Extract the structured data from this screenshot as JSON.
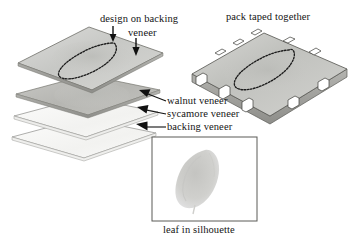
{
  "figure": {
    "background_color": "#ffffff",
    "ink_color": "#141414"
  },
  "labels": {
    "design_on_backing": "design on backing",
    "veneer_second_line": "veneer",
    "pack_taped_together": "pack taped together",
    "walnut_veneer": "walnut veneer",
    "sycamore_veneer": "sycamore veneer",
    "backing_veneer": "backing veneer",
    "leaf_in_silhouette": "leaf in silhouette"
  },
  "diagram": {
    "stack": {
      "name": "exploded veneer stack",
      "layer_count": 4,
      "layers": [
        {
          "name": "design on backing veneer",
          "fill": "#cfd0ce",
          "edge": "#6b6b6b"
        },
        {
          "name": "walnut veneer",
          "fill": "#bdbdba",
          "edge": "#6b6b6b"
        },
        {
          "name": "sycamore veneer",
          "fill": "#f6f6f4",
          "edge": "#8a8a8a"
        },
        {
          "name": "backing veneer",
          "fill": "#fbfbfa",
          "edge": "#8a8a8a"
        }
      ],
      "design_outline": "dotted leaf outline"
    },
    "pack": {
      "name": "pack taped together",
      "fill": "#cacac7",
      "edge": "#5a5a5a",
      "tape_tab_color": "#ffffff",
      "tape_tab_count": 10
    },
    "silhouette_box": {
      "name": "leaf in silhouette frame",
      "border_color": "#5a5a5a",
      "fill": "#ffffff",
      "leaf_color": "#cdcdcb"
    }
  },
  "arrows": [
    {
      "name": "arrow-design-to-outline",
      "direction": "down"
    },
    {
      "name": "arrow-veneer-to-top-layer",
      "direction": "down"
    },
    {
      "name": "arrow-walnut",
      "direction": "up-left"
    },
    {
      "name": "arrow-sycamore",
      "direction": "up-left"
    },
    {
      "name": "arrow-backing",
      "direction": "up-left"
    }
  ]
}
